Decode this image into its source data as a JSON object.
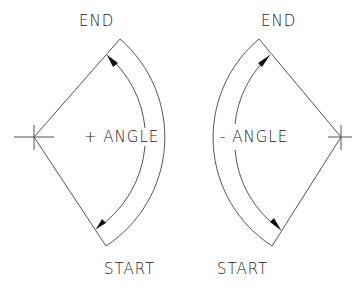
{
  "diagram": {
    "left": {
      "end_label": "END",
      "start_label": "START",
      "angle_label": "+ ANGLE",
      "center": [
        34,
        137
      ],
      "start_point": [
        106,
        246
      ],
      "end_point": [
        120,
        39
      ],
      "direction": "counterclockwise"
    },
    "right": {
      "end_label": "END",
      "start_label": "START",
      "angle_label": "- ANGLE",
      "center": [
        341,
        137
      ],
      "start_point": [
        272,
        246
      ],
      "end_point": [
        259,
        39
      ],
      "direction": "clockwise"
    },
    "colors": {
      "line": "#555555",
      "text": "#222222",
      "background": "#ffffff"
    }
  }
}
